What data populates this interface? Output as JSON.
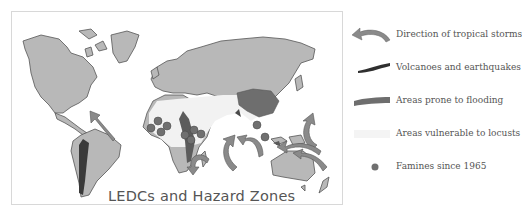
{
  "map": {
    "title": "LEDCs and Hazard Zones",
    "colors": {
      "land": "#b8b8b8",
      "outline": "#555555",
      "locust_zone": "#f0f0f0",
      "flooding": "#6e6e6e",
      "volcano": "#3a3a3a",
      "famine": "#707070",
      "storm_arrow": "#8a8a8a"
    }
  },
  "legend": {
    "items": [
      {
        "symbol": "storm-arrow",
        "label": "Direction of tropical storms"
      },
      {
        "symbol": "volcano-band",
        "label": "Volcanoes and earthquakes"
      },
      {
        "symbol": "flood-band",
        "label": "Areas prone to flooding"
      },
      {
        "symbol": "locust-band",
        "label": "Areas vulnerable to locusts"
      },
      {
        "symbol": "famine-dot",
        "label": "Famines since 1965"
      }
    ]
  }
}
